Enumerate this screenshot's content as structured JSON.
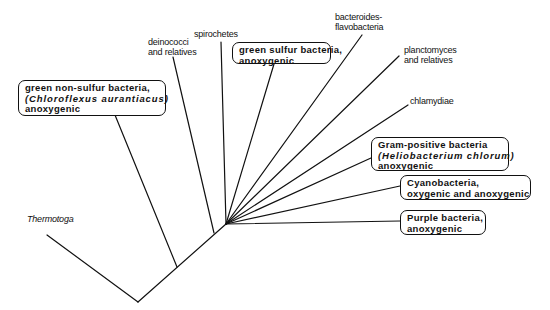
{
  "diagram": {
    "type": "phylogenetic-tree",
    "root": {
      "x": 138,
      "y": 302
    },
    "nodes": {
      "chloroflexus_node": {
        "x": 177,
        "y": 267
      },
      "deinococci_node": {
        "x": 214,
        "y": 233
      },
      "radiation_node": {
        "x": 226,
        "y": 224
      }
    },
    "taxa": [
      {
        "id": "thermotoga",
        "lines": [
          "Thermotoga"
        ],
        "italic": true,
        "boxed": false
      },
      {
        "id": "green-non-sulfur",
        "lines": [
          "green non-sulfur bacteria,",
          "(Chloroflexus aurantiacus)",
          "anoxygenic"
        ],
        "boxed": true,
        "photosynthetic": true
      },
      {
        "id": "deinococci",
        "lines": [
          "deinococci",
          "and relatives"
        ],
        "boxed": false
      },
      {
        "id": "spirochetes",
        "lines": [
          "spirochetes"
        ],
        "boxed": false
      },
      {
        "id": "green-sulfur",
        "lines": [
          "green sulfur bacteria,",
          "anoxygenic"
        ],
        "boxed": true,
        "photosynthetic": true
      },
      {
        "id": "bacteroides",
        "lines": [
          "bacteroides-",
          "flavobacteria"
        ],
        "boxed": false
      },
      {
        "id": "planctomyces",
        "lines": [
          "planctomyces",
          "and relatives"
        ],
        "boxed": false
      },
      {
        "id": "chlamydiae",
        "lines": [
          "chlamydiae"
        ],
        "boxed": false
      },
      {
        "id": "gram-positive",
        "lines": [
          "Gram-positive bacteria",
          "(Heliobacterium chlorum)",
          "anoxygenic"
        ],
        "boxed": true,
        "photosynthetic": true
      },
      {
        "id": "cyanobacteria",
        "lines": [
          "Cyanobacteria,",
          "oxygenic and anoxygenic"
        ],
        "boxed": true,
        "photosynthetic": true
      },
      {
        "id": "purple",
        "lines": [
          "Purple bacteria,",
          "anoxygenic"
        ],
        "boxed": true,
        "photosynthetic": true
      }
    ]
  },
  "colors": {
    "line": "#111111",
    "background": "#ffffff",
    "text": "#111111"
  }
}
